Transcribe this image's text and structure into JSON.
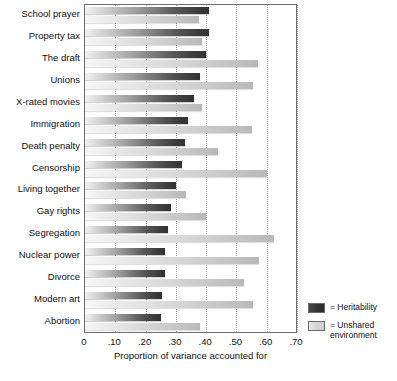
{
  "chart_data": {
    "type": "bar",
    "orientation": "horizontal",
    "title": "",
    "xlabel": "Proportion of variance accounted for",
    "ylabel": "",
    "xlim": [
      0,
      0.7
    ],
    "xticks": [
      0,
      0.1,
      0.2,
      0.3,
      0.4,
      0.5,
      0.6,
      0.7
    ],
    "xtick_labels": [
      "0",
      ".10",
      ".20",
      ".30",
      ".40",
      ".50",
      ".60",
      ".70"
    ],
    "grid": "vertical-dotted",
    "legend_position": "right",
    "categories": [
      "School prayer",
      "Property tax",
      "The draft",
      "Unions",
      "X-rated movies",
      "Immigration",
      "Death penalty",
      "Censorship",
      "Living together",
      "Gay rights",
      "Segregation",
      "Nuclear power",
      "Divorce",
      "Modern art",
      "Abortion"
    ],
    "series": [
      {
        "name": "Heritability",
        "color": "#3a3a3a",
        "values": [
          0.41,
          0.41,
          0.4,
          0.38,
          0.36,
          0.34,
          0.33,
          0.32,
          0.3,
          0.285,
          0.275,
          0.265,
          0.265,
          0.255,
          0.25
        ]
      },
      {
        "name": "Unshared environment",
        "color": "#c8c8c8",
        "values": [
          0.375,
          0.385,
          0.57,
          0.555,
          0.385,
          0.55,
          0.44,
          0.6,
          0.335,
          0.4,
          0.625,
          0.575,
          0.525,
          0.555,
          0.38
        ]
      }
    ]
  },
  "legend": {
    "items": [
      {
        "prefix": "= ",
        "label": "Heritability",
        "swatch": "dark"
      },
      {
        "prefix": "= ",
        "label": "Unshared environment",
        "swatch": "light"
      }
    ]
  }
}
